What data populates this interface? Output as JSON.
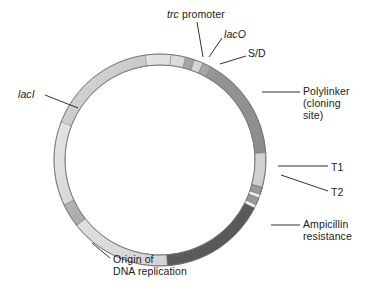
{
  "figure": {
    "type": "plasmid-map",
    "title": "",
    "background_color": "#ffffff",
    "text_color": "#1a1a1a",
    "circle": {
      "center_x": 160,
      "center_y": 160,
      "outer_radius": 106,
      "inner_radius": 95
    }
  },
  "labels": {
    "trc_promoter": {
      "italic_part": "trc",
      "roman_part": " promoter"
    },
    "laco": "lacO",
    "sd": "S/D",
    "polylinker_line1": "Polylinker",
    "polylinker_line2": "(cloning",
    "polylinker_line3": "site)",
    "t1": "T1",
    "t2": "T2",
    "ampicillin_line1": "Ampicillin",
    "ampicillin_line2": "resistance",
    "laci": "lacI",
    "origin_line1": "Origin of",
    "origin_line2": "DNA replication"
  },
  "colors": {
    "ampicillin_resistance": "#5a5a5a",
    "polylinker": "#8d8d8d",
    "laci": "#b4b4b4",
    "light_backbone": "#dcdcdc",
    "mid_backbone": "#c8c8c8",
    "origin_band": "#a8a8a8",
    "promoter_band": "#d2d2d2",
    "laco_band": "#909090",
    "sd_band": "#9a9a9a",
    "terminator_band": "#9e9e9e",
    "outline": "#6b6b6b",
    "leader_line": "#1a1a1a"
  },
  "chart_data": {
    "type": "pie",
    "xlabel": "",
    "ylabel": "",
    "legend_position": "callout-labels",
    "grid": false,
    "note": "Angles measured clockwise from 12 o'clock (top) in degrees.",
    "segments": [
      {
        "name": "lacI",
        "label": "lacI",
        "start_deg": 291,
        "end_deg": 352,
        "color": "#b4b4b4",
        "callout": true
      },
      {
        "name": "backbone-upper-left",
        "label": "",
        "start_deg": 352,
        "end_deg": 6,
        "color": "#d6d6d6",
        "callout": false
      },
      {
        "name": "trc promoter",
        "label": "trc promoter",
        "start_deg": 6,
        "end_deg": 14,
        "color": "#d2d2d2",
        "callout": true
      },
      {
        "name": "lacO",
        "label": "lacO",
        "start_deg": 14,
        "end_deg": 19,
        "color": "#909090",
        "callout": true
      },
      {
        "name": "spacer",
        "label": "",
        "start_deg": 19,
        "end_deg": 24,
        "color": "#cfcfcf",
        "callout": false
      },
      {
        "name": "S/D",
        "label": "S/D",
        "start_deg": 24,
        "end_deg": 29,
        "color": "#9a9a9a",
        "callout": true
      },
      {
        "name": "Polylinker (cloning site)",
        "label": "Polylinker (cloning site)",
        "start_deg": 29,
        "end_deg": 86,
        "color": "#8d8d8d",
        "callout": true
      },
      {
        "name": "backbone-right",
        "label": "",
        "start_deg": 86,
        "end_deg": 105,
        "color": "#d8d8d8",
        "callout": false
      },
      {
        "name": "T1",
        "label": "T1",
        "start_deg": 105,
        "end_deg": 109,
        "color": "#9e9e9e",
        "callout": true
      },
      {
        "name": "T2",
        "label": "T2",
        "start_deg": 111,
        "end_deg": 115,
        "color": "#9e9e9e",
        "callout": true
      },
      {
        "name": "Ampicillin resistance",
        "label": "Ampicillin resistance",
        "start_deg": 117,
        "end_deg": 176,
        "color": "#5a5a5a",
        "callout": true
      },
      {
        "name": "backbone-bottom",
        "label": "",
        "start_deg": 176,
        "end_deg": 232,
        "color": "#dcdcdc",
        "callout": false
      },
      {
        "name": "Origin of DNA replication",
        "label": "Origin of DNA replication",
        "start_deg": 232,
        "end_deg": 245,
        "color": "#a8a8a8",
        "callout": true
      },
      {
        "name": "backbone-lower-left",
        "label": "",
        "start_deg": 245,
        "end_deg": 291,
        "color": "#d4d4d4",
        "callout": false
      }
    ]
  },
  "leaders": [
    {
      "name": "trc-promoter-leader",
      "x1": 197,
      "y1": 22,
      "x2": 203,
      "y2": 57
    },
    {
      "name": "laco-leader",
      "x1": 222,
      "y1": 38,
      "x2": 209,
      "y2": 57
    },
    {
      "name": "sd-leader",
      "x1": 246,
      "y1": 56,
      "x2": 220,
      "y2": 64
    },
    {
      "name": "polylinker-leader",
      "x1": 300,
      "y1": 92,
      "x2": 262,
      "y2": 92
    },
    {
      "name": "t1-leader",
      "x1": 328,
      "y1": 166,
      "x2": 278,
      "y2": 166
    },
    {
      "name": "t2-leader",
      "x1": 328,
      "y1": 191,
      "x2": 281,
      "y2": 175
    },
    {
      "name": "ampicillin-leader",
      "x1": 300,
      "y1": 225,
      "x2": 271,
      "y2": 225
    },
    {
      "name": "laci-leader",
      "x1": 45,
      "y1": 95,
      "x2": 78,
      "y2": 108
    },
    {
      "name": "origin-leader",
      "x1": 110,
      "y1": 258,
      "x2": 92,
      "y2": 243
    }
  ]
}
